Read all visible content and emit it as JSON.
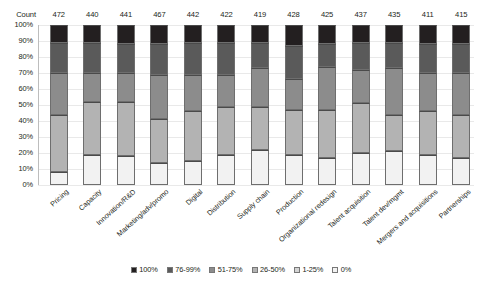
{
  "chart_data": {
    "type": "bar",
    "title": "",
    "subtitle": "",
    "xlabel": "",
    "ylabel": "",
    "ylim": [
      0,
      100
    ],
    "stacked": true,
    "normalized_percent": true,
    "grid": true,
    "legend_position": "bottom",
    "count_row_label": "Count",
    "categories": [
      "Pricing",
      "Capacity",
      "Innovation/R&D",
      "Marketing/adv/promo",
      "Digital",
      "Distribution",
      "Supply chain",
      "Production",
      "Organizational redesign",
      "Talent acquisition",
      "Talent dev/mgmt",
      "Mergers and acquisitions",
      "Partnerships"
    ],
    "counts": [
      472,
      440,
      441,
      467,
      442,
      422,
      419,
      428,
      425,
      437,
      435,
      411,
      415
    ],
    "ytick_labels": [
      "0%",
      "10%",
      "20%",
      "30%",
      "40%",
      "50%",
      "60%",
      "70%",
      "80%",
      "90%",
      "100%"
    ],
    "ytick_values": [
      0,
      10,
      20,
      30,
      40,
      50,
      60,
      70,
      80,
      90,
      100
    ],
    "series": [
      {
        "name": "100%",
        "color": "#231f20",
        "values": [
          11,
          11,
          12,
          12,
          11,
          11,
          11,
          13,
          12,
          11,
          11,
          12,
          12
        ]
      },
      {
        "name": "76-99%",
        "color": "#5a5a5a",
        "values": [
          19,
          19,
          18,
          19,
          20,
          20,
          16,
          21,
          14,
          17,
          16,
          18,
          18
        ]
      },
      {
        "name": "51-75%",
        "color": "#8c8c8c",
        "values": [
          26,
          18,
          18,
          28,
          23,
          20,
          24,
          19,
          27,
          21,
          29,
          24,
          26
        ]
      },
      {
        "name": "26-50%",
        "color": "#b3b3b3",
        "values": [
          36,
          33,
          34,
          27,
          31,
          30,
          27,
          28,
          30,
          31,
          23,
          27,
          27
        ]
      },
      {
        "name": "1-25%",
        "color": "#d4d4d4",
        "values": [
          0,
          0,
          0,
          0,
          0,
          0,
          0,
          0,
          0,
          0,
          0,
          0,
          0
        ]
      },
      {
        "name": "0%",
        "color": "#f2f2f2",
        "values": [
          8,
          19,
          18,
          14,
          15,
          19,
          22,
          19,
          17,
          20,
          21,
          19,
          17
        ]
      }
    ],
    "legend": [
      {
        "label": "100%",
        "color": "#231f20"
      },
      {
        "label": "76-99%",
        "color": "#5a5a5a"
      },
      {
        "label": "51-75%",
        "color": "#8c8c8c"
      },
      {
        "label": "26-50%",
        "color": "#b3b3b3"
      },
      {
        "label": "1-25%",
        "color": "#d4d4d4"
      },
      {
        "label": "0%",
        "color": "#f2f2f2"
      }
    ]
  }
}
